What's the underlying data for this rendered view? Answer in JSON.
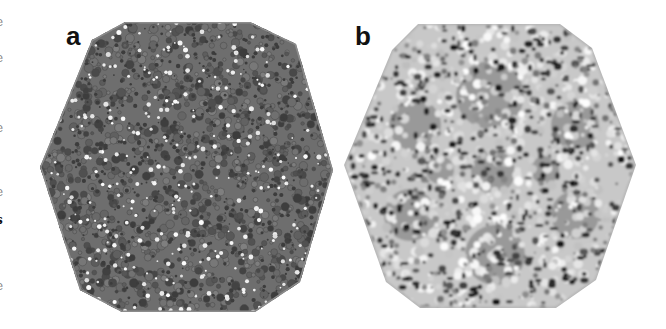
{
  "figure": {
    "panels": [
      {
        "label": "a",
        "subject": "virus capsid surface rendering (icosahedral particle)",
        "style": "dense mid-gray surface with white highlight residues"
      },
      {
        "label": "b",
        "subject": "virus capsid surface rendering (icosahedral particle)",
        "style": "light mottled surface with dark pores and gray patches"
      }
    ],
    "edge_text_fragments": [
      "e",
      "e",
      ".",
      "e",
      ".",
      "e",
      "s",
      ".",
      "e",
      "."
    ],
    "colors": {
      "background": "#ffffff",
      "capsid_a_base": "#6e6e6e",
      "capsid_a_dark": "#3c3c3c",
      "capsid_a_highlight": "#f2f2f2",
      "capsid_b_base": "#c8c8c8",
      "capsid_b_light": "#f0f0f0",
      "capsid_b_dark": "#1e1e1e",
      "capsid_b_patch": "#8a8a8a",
      "label": "#111111"
    }
  }
}
